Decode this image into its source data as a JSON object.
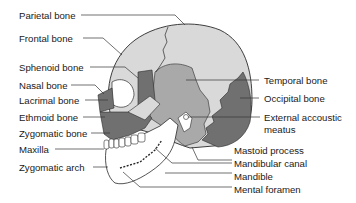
{
  "diagram": {
    "type": "labeled-anatomy-illustration",
    "colors": {
      "light_bone": "#d9d9d9",
      "medium_bone": "#a9a9a9",
      "dark_bone": "#707070",
      "outline": "#2a2a2a",
      "leader_line": "#333333",
      "teeth": "#ffffff"
    },
    "labels_left": [
      {
        "id": "parietal",
        "text": "Parietal bone"
      },
      {
        "id": "frontal",
        "text": "Frontal bone"
      },
      {
        "id": "sphenoid",
        "text": "Sphenoid bone"
      },
      {
        "id": "nasal",
        "text": "Nasal bone"
      },
      {
        "id": "lacrimal",
        "text": "Lacrimal bone"
      },
      {
        "id": "ethmoid",
        "text": "Ethmoid bone"
      },
      {
        "id": "zygomatic",
        "text": "Zygomatic bone"
      },
      {
        "id": "maxilla",
        "text": "Maxilla"
      },
      {
        "id": "zygomatic_arch",
        "text": "Zygomatic arch"
      }
    ],
    "labels_right": [
      {
        "id": "temporal",
        "text": "Temporal bone"
      },
      {
        "id": "occipital",
        "text": "Occipital bone"
      },
      {
        "id": "eam_1",
        "text": "External accoustic"
      },
      {
        "id": "eam_2",
        "text": "meatus"
      },
      {
        "id": "mastoid",
        "text": "Mastoid process"
      },
      {
        "id": "mandibular_canal",
        "text": "Mandibular canal"
      },
      {
        "id": "mandible",
        "text": "Mandible"
      },
      {
        "id": "mental_foramen",
        "text": "Mental foramen"
      }
    ]
  }
}
